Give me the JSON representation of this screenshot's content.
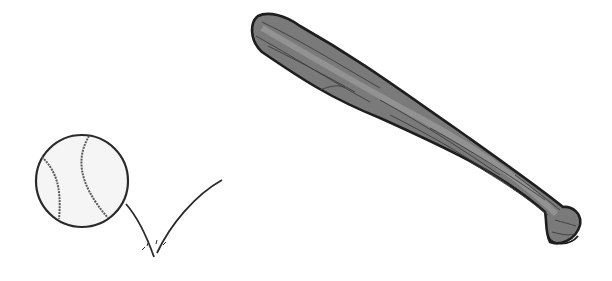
{
  "illustration": {
    "subject": "baseball and bat",
    "objects": [
      {
        "name": "baseball",
        "shape": "circle with stitched seams"
      },
      {
        "name": "bounce-trajectory",
        "shape": "V-shaped line with impact marks"
      },
      {
        "name": "baseball-bat",
        "shape": "wooden bat with grain lines"
      }
    ],
    "colors": {
      "background": "#ffffff",
      "outline": "#2a2a2a",
      "ball_fill": "#f4f4f4",
      "seam": "#555555",
      "bat_fill": "#6e6e6e",
      "bat_highlight": "#9a9a9a",
      "grain": "#3c3c3c"
    }
  }
}
